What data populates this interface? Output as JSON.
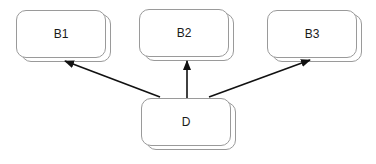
{
  "diagram": {
    "nodes": [
      {
        "id": "B1",
        "label": "B1"
      },
      {
        "id": "B2",
        "label": "B2"
      },
      {
        "id": "B3",
        "label": "B3"
      },
      {
        "id": "D",
        "label": "D"
      }
    ],
    "edges": [
      {
        "from": "D",
        "to": "B1"
      },
      {
        "from": "D",
        "to": "B2"
      },
      {
        "from": "D",
        "to": "B3"
      }
    ],
    "colors": {
      "edge": "#111111",
      "border": "#9a9a9a",
      "background": "#ffffff"
    }
  }
}
